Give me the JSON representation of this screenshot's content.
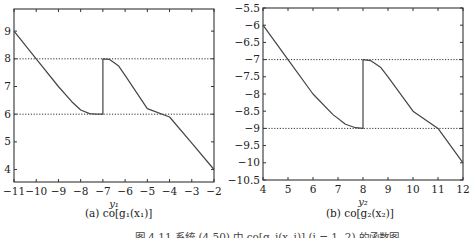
{
  "figure": {
    "caption": "图 4.11  系统 (4.50) 中 co[g_i(x_i)] (i = 1, 2) 的函数图"
  },
  "chart_data": [
    {
      "type": "line",
      "panel": "a",
      "caption": "(a) co[g₁(x₁)]",
      "xlabel": "y₁",
      "ylabel": "",
      "xlim": [
        -11,
        -2
      ],
      "ylim": [
        3.55,
        9.8
      ],
      "xticks": [
        -11,
        -10,
        -9,
        -8,
        -7,
        -6,
        -5,
        -4,
        -3,
        -2
      ],
      "yticks": [
        4,
        5,
        6,
        7,
        8,
        9
      ],
      "grid": false,
      "reference_lines": [
        8,
        6
      ],
      "series": [
        {
          "name": "co[g1(x1)]",
          "x": [
            -11,
            -10,
            -9,
            -8.4,
            -8,
            -7.6,
            -7.3,
            -7,
            -7,
            -6.7,
            -6.3,
            -6,
            -5,
            -4,
            -3,
            -2
          ],
          "values": [
            9,
            8,
            7,
            6.45,
            6.15,
            6.02,
            6,
            6,
            8,
            7.98,
            7.75,
            7.4,
            6.2,
            5.9,
            4.95,
            4
          ]
        }
      ]
    },
    {
      "type": "line",
      "panel": "b",
      "caption": "(b) co[g₂(x₂)]",
      "xlabel": "y₂",
      "ylabel": "",
      "xlim": [
        4,
        12
      ],
      "ylim": [
        -10.5,
        -5.5
      ],
      "xticks": [
        4,
        5,
        6,
        7,
        8,
        9,
        10,
        11,
        12
      ],
      "yticks": [
        -5.5,
        -6,
        -6.5,
        -7,
        -7.5,
        -8,
        -8.5,
        -9,
        -9.5,
        -10,
        -10.5
      ],
      "grid": false,
      "reference_lines": [
        -7,
        -9
      ],
      "series": [
        {
          "name": "co[g2(x2)]",
          "x": [
            4,
            5,
            6,
            6.8,
            7.3,
            7.7,
            8,
            8,
            8.3,
            8.7,
            9,
            10,
            11,
            12
          ],
          "values": [
            -6,
            -7,
            -8,
            -8.6,
            -8.88,
            -8.98,
            -9,
            -7,
            -7.03,
            -7.22,
            -7.5,
            -8.5,
            -9,
            -10
          ]
        }
      ]
    }
  ]
}
